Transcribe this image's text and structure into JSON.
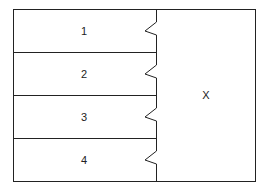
{
  "diagram": {
    "rows": [
      {
        "label": "1"
      },
      {
        "label": "2"
      },
      {
        "label": "3"
      },
      {
        "label": "4"
      }
    ],
    "right_panel": {
      "label": "X"
    },
    "colors": {
      "stroke": "#222222",
      "background": "#ffffff"
    }
  }
}
